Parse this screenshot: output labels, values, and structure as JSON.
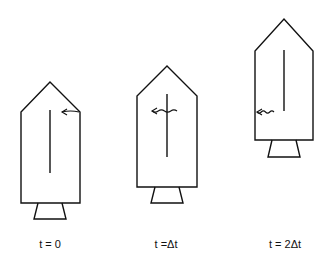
{
  "diagram": {
    "colors": {
      "line": "#111111",
      "background": "#ffffff"
    },
    "rockets": [
      {
        "label": "t = 0",
        "apex": [
          50,
          82
        ],
        "shoulder_y": 112,
        "left_x": 21,
        "right_x": 80,
        "body_bottom_y": 203,
        "nozzle": {
          "top_left": 38,
          "top_right": 62,
          "bottom_left": 34,
          "bottom_right": 66,
          "bottom_y": 219
        },
        "inner_line": {
          "x": 50,
          "y1": 110,
          "y2": 173
        },
        "signal": {
          "type": "arrow",
          "y": 112,
          "x_start": 79,
          "x_end": 62
        }
      },
      {
        "label": "t =Δt",
        "apex": [
          167,
          66
        ],
        "shoulder_y": 96,
        "left_x": 137,
        "right_x": 197,
        "body_bottom_y": 187,
        "nozzle": {
          "top_left": 155,
          "top_right": 179,
          "bottom_left": 151,
          "bottom_right": 183,
          "bottom_y": 203
        },
        "inner_line": {
          "x": 167,
          "y1": 94,
          "y2": 157
        },
        "signal": {
          "type": "wavy-arrow",
          "y": 111,
          "x_start": 177,
          "x_end": 152
        }
      },
      {
        "label": "t = 2Δt",
        "apex": [
          284,
          19
        ],
        "shoulder_y": 51,
        "left_x": 255,
        "right_x": 313,
        "body_bottom_y": 140,
        "nozzle": {
          "top_left": 272,
          "top_right": 296,
          "bottom_left": 268,
          "bottom_right": 300,
          "bottom_y": 157
        },
        "inner_line": {
          "x": 284,
          "y1": 50,
          "y2": 111
        },
        "signal": {
          "type": "wavy-arrow",
          "y": 112,
          "x_start": 274,
          "x_end": 257
        }
      }
    ],
    "label_y": 248,
    "label_x": [
      50,
      166,
      285
    ]
  }
}
